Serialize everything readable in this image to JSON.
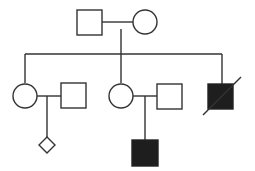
{
  "diagram": {
    "type": "pedigree",
    "colors": {
      "line": "#333333",
      "affected_fill": "#1e1e1e",
      "unaffected_fill": "#ffffff",
      "background": "#ffffff"
    },
    "generations": [
      {
        "level": "I",
        "individuals": [
          {
            "id": "I-1",
            "sex": "male",
            "shape": "square",
            "affected": false,
            "deceased": false
          },
          {
            "id": "I-2",
            "sex": "female",
            "shape": "circle",
            "affected": false,
            "deceased": false
          }
        ]
      },
      {
        "level": "II",
        "individuals": [
          {
            "id": "II-1",
            "sex": "female",
            "shape": "circle",
            "affected": false,
            "deceased": false
          },
          {
            "id": "II-2",
            "sex": "male",
            "shape": "square",
            "affected": false,
            "deceased": false,
            "note": "spouse"
          },
          {
            "id": "II-3",
            "sex": "female",
            "shape": "circle",
            "affected": false,
            "deceased": false
          },
          {
            "id": "II-4",
            "sex": "male",
            "shape": "square",
            "affected": false,
            "deceased": false,
            "note": "spouse"
          },
          {
            "id": "II-5",
            "sex": "male",
            "shape": "square",
            "affected": true,
            "deceased": true
          }
        ]
      },
      {
        "level": "III",
        "individuals": [
          {
            "id": "III-1",
            "sex": "unknown",
            "shape": "diamond",
            "affected": false,
            "deceased": false
          },
          {
            "id": "III-2",
            "sex": "male",
            "shape": "square",
            "affected": true,
            "deceased": false
          }
        ]
      }
    ],
    "relationships": [
      {
        "type": "mating",
        "partners": [
          "I-1",
          "I-2"
        ],
        "children": [
          "II-1",
          "II-3",
          "II-5"
        ]
      },
      {
        "type": "mating",
        "partners": [
          "II-1",
          "II-2"
        ],
        "children": [
          "III-1"
        ]
      },
      {
        "type": "mating",
        "partners": [
          "II-3",
          "II-4"
        ],
        "children": [
          "III-2"
        ]
      }
    ]
  }
}
